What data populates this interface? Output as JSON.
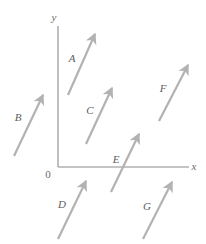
{
  "figure": {
    "background_color": "#ffffff",
    "width": 206,
    "height": 244
  },
  "axes": {
    "color": "#b0b0b0",
    "stroke_width": 1.6,
    "origin": {
      "x": 58,
      "y": 167
    },
    "y_axis": {
      "x": 58,
      "y_top": 26,
      "y_bottom": 167
    },
    "x_axis": {
      "y": 167,
      "x_left": 58,
      "x_right": 189
    },
    "x_label": {
      "text": "x",
      "x": 194,
      "y": 170
    },
    "y_label": {
      "text": "y",
      "x": 54,
      "y": 21
    },
    "origin_label": {
      "text": "0",
      "x": 48,
      "y": 178
    }
  },
  "vectors": {
    "color": "#b2b2b2",
    "stroke_width": 2.2,
    "items": [
      {
        "label": "A",
        "x1": 68,
        "y1": 95,
        "x2": 95,
        "y2": 34,
        "label_x": 72,
        "label_y": 62
      },
      {
        "label": "B",
        "x1": 14,
        "y1": 156,
        "x2": 43,
        "y2": 95,
        "label_x": 18,
        "label_y": 121
      },
      {
        "label": "C",
        "x1": 86,
        "y1": 144,
        "x2": 112,
        "y2": 88,
        "label_x": 90,
        "label_y": 114
      },
      {
        "label": "D",
        "x1": 58,
        "y1": 239,
        "x2": 86,
        "y2": 181,
        "label_x": 62,
        "label_y": 208
      },
      {
        "label": "E",
        "x1": 111,
        "y1": 192,
        "x2": 139,
        "y2": 134,
        "label_x": 116,
        "label_y": 163
      },
      {
        "label": "F",
        "x1": 159,
        "y1": 121,
        "x2": 188,
        "y2": 65,
        "label_x": 163,
        "label_y": 92
      },
      {
        "label": "G",
        "x1": 143,
        "y1": 239,
        "x2": 172,
        "y2": 182,
        "label_x": 147,
        "label_y": 210
      }
    ]
  }
}
